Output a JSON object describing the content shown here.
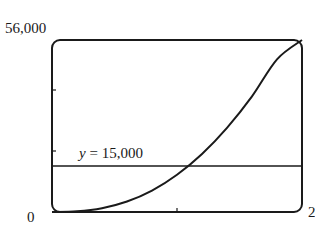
{
  "chart_data": {
    "type": "line",
    "title": "",
    "xlabel": "",
    "ylabel": "",
    "xlim": [
      0,
      20
    ],
    "ylim": [
      0,
      56000
    ],
    "y_tick_labels": [
      "0",
      "56,000"
    ],
    "x_tick_labels": [
      "2"
    ],
    "x_ticks": [
      10
    ],
    "y_ticks": [
      20000,
      40000
    ],
    "grid": false,
    "legend": null,
    "series": [
      {
        "name": "curve",
        "x": [
          0,
          2,
          4,
          6,
          8,
          10,
          12,
          14,
          16,
          18,
          20
        ],
        "y": [
          0,
          220,
          1230,
          3400,
          6960,
          12120,
          18890,
          27400,
          37650,
          49700,
          56000
        ]
      },
      {
        "name": "y = 15,000",
        "x": [
          0,
          20
        ],
        "y": [
          15000,
          15000
        ]
      }
    ],
    "annotations": [
      {
        "text_var": "y",
        "text_rest": " = 15,000",
        "x": 2,
        "y": 15000
      }
    ],
    "intersection_x_approx": 11.6,
    "colors": {
      "line": "#1a1a1a",
      "frame": "#1a1a1a",
      "background": "#ffffff"
    }
  },
  "labels": {
    "y_max": "56,000",
    "y_min": "0",
    "x_max": "2",
    "hline_var": "y",
    "hline_rest": " = 15,000"
  }
}
